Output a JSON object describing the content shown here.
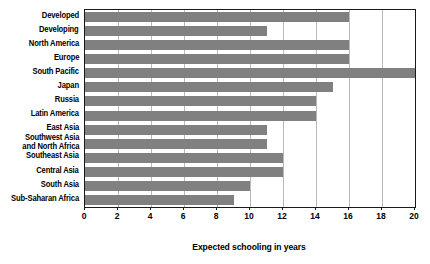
{
  "chart_data": {
    "type": "bar",
    "orientation": "horizontal",
    "title": "",
    "xlabel": "Expected schooling in years",
    "ylabel": "",
    "xlim": [
      0,
      20
    ],
    "xticks": [
      0,
      2,
      4,
      6,
      8,
      10,
      12,
      14,
      16,
      18,
      20
    ],
    "xtick_labels": [
      "0",
      "2",
      "4",
      "6",
      "8",
      "10",
      "12",
      "14",
      "16",
      "18",
      "20"
    ],
    "grid": "vertical",
    "legend": "none",
    "bar_color": "#808080",
    "categories": [
      "Developed",
      "Developing",
      "North America",
      "Europe",
      "South Pacific",
      "Japan",
      "Russia",
      "Latin America",
      "East Asia",
      "Southwest Asia\nand North Africa",
      "Southeast Asia",
      "Central Asia",
      "South Asia",
      "Sub-Saharan Africa"
    ],
    "values": [
      16,
      11,
      16,
      16,
      20,
      15,
      14,
      14,
      11,
      11,
      12,
      12,
      10,
      9
    ]
  }
}
